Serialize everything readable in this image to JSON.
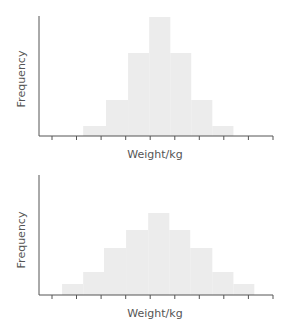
{
  "chart_data": [
    {
      "type": "bar",
      "subtype": "histogram",
      "title": "",
      "xlabel": "Weight/kg",
      "ylabel": "Frequency",
      "x_tick_count": 10,
      "x_tick_labels": [],
      "y_tick_labels": [],
      "xlim": [
        -0.55,
        9
      ],
      "ylim": [
        0,
        12
      ],
      "grid": false,
      "bin_edges": [
        1.27,
        2.2,
        3.1,
        3.96,
        4.82,
        5.67,
        6.53,
        7.39
      ],
      "values": [
        1.0,
        3.6,
        8.3,
        11.9,
        8.3,
        3.6,
        1.0
      ],
      "bar_color": "#ececec",
      "axis_color": "#555555"
    },
    {
      "type": "bar",
      "subtype": "histogram",
      "title": "",
      "xlabel": "Weight/kg",
      "ylabel": "Frequency",
      "x_tick_count": 10,
      "x_tick_labels": [],
      "y_tick_labels": [],
      "xlim": [
        -0.55,
        9
      ],
      "ylim": [
        0,
        12
      ],
      "grid": false,
      "bin_edges": [
        0.41,
        1.27,
        2.12,
        3.02,
        3.92,
        4.78,
        5.63,
        6.53,
        7.39,
        8.24
      ],
      "values": [
        1.1,
        2.3,
        4.7,
        6.5,
        8.2,
        6.5,
        4.7,
        2.3,
        1.1
      ],
      "bar_color": "#ececec",
      "axis_color": "#555555"
    }
  ]
}
